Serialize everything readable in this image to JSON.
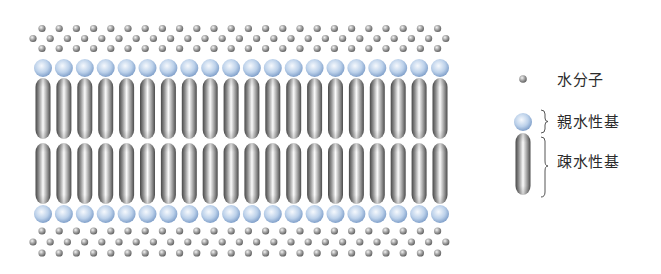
{
  "figure": {
    "colors": {
      "background": "#ffffff",
      "water_light": "#f2f2f2",
      "water_mid": "#a8a8a8",
      "water_dark": "#5a5a5a",
      "head_light": "#f4f8fd",
      "head_mid": "#b9cfe9",
      "head_dark": "#7496c4",
      "tail_light": "#fbfbfb",
      "tail_mid": "#b5b5b5",
      "tail_dark": "#4a4a4a",
      "text": "#2b2b2b",
      "brace": "#555555"
    },
    "layout": {
      "columns": 20,
      "column_start_x": 43,
      "column_end_x": 440,
      "head_radius": 9,
      "top_head_y": 68,
      "bottom_head_y": 214,
      "tail_width": 15,
      "upper_tail": {
        "top": 78,
        "bottom": 139
      },
      "lower_tail": {
        "top": 143,
        "bottom": 204
      },
      "water_radius": 3.6,
      "water_rows_top": [
        {
          "y": 28.5,
          "x_start": 42,
          "count": 24,
          "step": 17.2
        },
        {
          "y": 38.5,
          "x_start": 33,
          "count": 25,
          "step": 17.2
        },
        {
          "y": 48.5,
          "x_start": 42,
          "count": 24,
          "step": 17.2
        }
      ],
      "water_rows_bottom": [
        {
          "y": 231,
          "x_start": 42,
          "count": 24,
          "step": 17.2
        },
        {
          "y": 242,
          "x_start": 33,
          "count": 25,
          "step": 17.2
        },
        {
          "y": 253,
          "x_start": 42,
          "count": 24,
          "step": 17.2
        }
      ]
    }
  },
  "legend": {
    "items": [
      {
        "label": "水分子",
        "symbol": "water-molecule"
      },
      {
        "label": "親水性基",
        "symbol": "hydrophilic-head"
      },
      {
        "label": "疎水性基",
        "symbol": "hydrophobic-tail"
      }
    ]
  }
}
